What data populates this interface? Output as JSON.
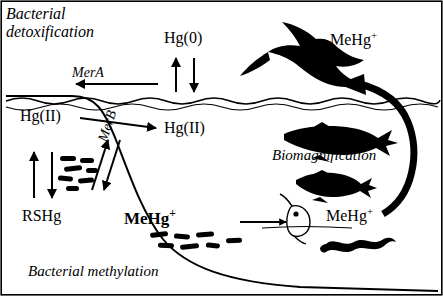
{
  "figure": {
    "type": "mercury-biogeochemical-cycle-diagram",
    "labels": {
      "bacterial_detoxification_line1": "Bacterial",
      "bacterial_detoxification_line2": "detoxification",
      "mer_a": "MerA",
      "mer_b": "MerB",
      "hg_zero": "Hg(0)",
      "hg_two_left": "Hg(II)",
      "hg_two_mid": "Hg(II)",
      "rshg": "RSHg",
      "memhg_bold": "MeHg",
      "memhg_bold_sup": "+",
      "memhg_right": "MeHg",
      "memhg_right_sup": "+",
      "memhg_top": "MeHg",
      "memhg_top_sup": "+",
      "biomagnification": "Biomagnification",
      "bacterial_methylation": "Bacterial methylation"
    },
    "silhouettes": [
      "bird-silhouette",
      "large-fish-silhouette",
      "small-fish-silhouette",
      "worm-silhouette",
      "plankton-silhouette",
      "bacteria-cluster-upper",
      "bacteria-cluster-sediment"
    ],
    "arrows": [
      "merA-arrow-left",
      "hg0-up-arrow",
      "hg0-down-arrow",
      "hg2-left-to-mid-arrow",
      "rshg-up-arrow",
      "rshg-down-arrow",
      "merB-up-arrow",
      "merB-down-arrow",
      "methylation-arrow-to-plankton",
      "biomagnification-curved-arrow"
    ],
    "colors": {
      "ink": "#000000",
      "background": "#ffffff"
    }
  }
}
